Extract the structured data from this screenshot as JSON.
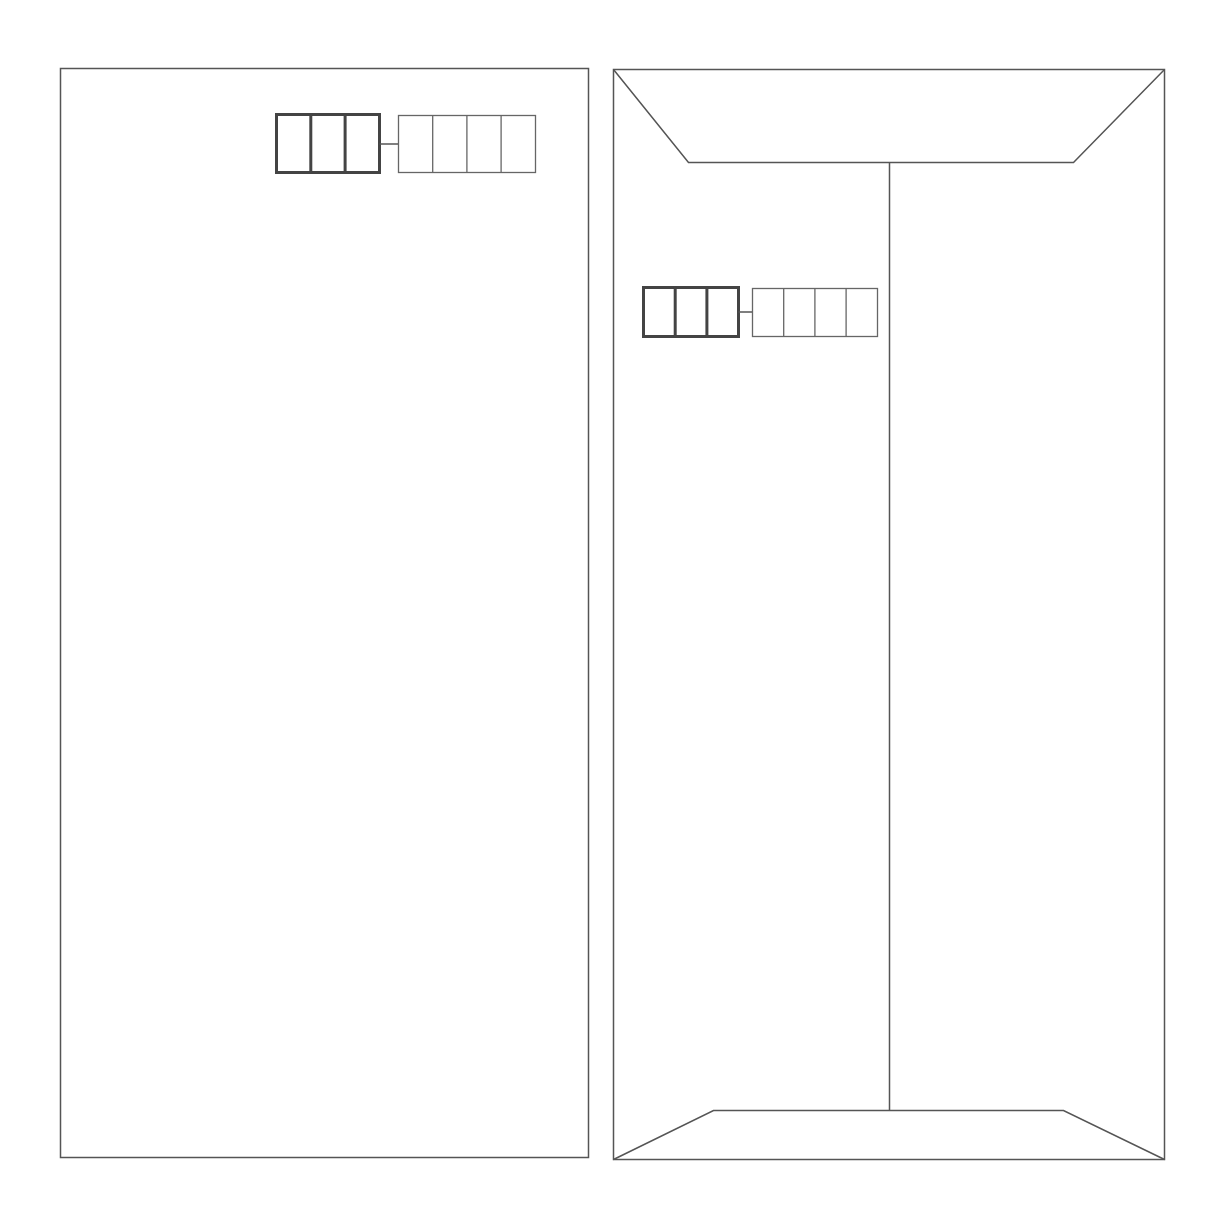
{
  "diagram": {
    "stroke_color": "#555555",
    "thick_stroke_color": "#444444",
    "background": "#ffffff",
    "envelopes": [
      {
        "name": "envelope-front",
        "label": "Front",
        "rect": {
          "x": 60,
          "y": 68,
          "w": 528,
          "h": 1089
        },
        "postal_code": {
          "x": 276,
          "y": 114,
          "cell_w": 34.3,
          "h": 58,
          "thick_cells": 3,
          "thin_cells": 4,
          "thin_x": 398,
          "thin_cell_w": 34.2
        }
      },
      {
        "name": "envelope-back",
        "label": "Back",
        "rect": {
          "x": 613,
          "y": 69,
          "w": 551,
          "h": 1090
        },
        "top_flap": {
          "left_x": 688,
          "right_x": 1073,
          "y": 162
        },
        "seam_x": 889,
        "bottom_flap": {
          "left_x": 713,
          "right_x": 1063,
          "y": 1110
        },
        "postal_code": {
          "x": 643,
          "y": 287,
          "cell_w": 31.7,
          "h": 49,
          "thick_cells": 3,
          "thin_cells": 4,
          "thin_x": 752,
          "thin_cell_w": 31.2
        }
      }
    ]
  }
}
